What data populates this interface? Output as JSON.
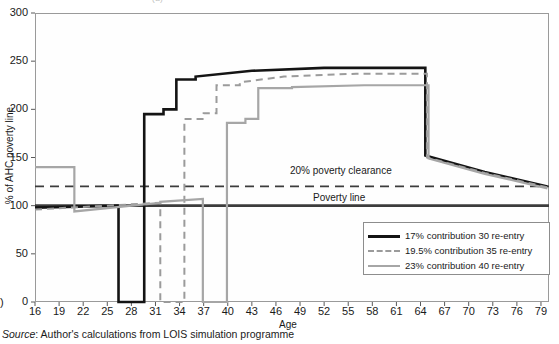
{
  "figure": {
    "title_sliver": "(a)",
    "source_prefix": "Source",
    "source_text": ": Author's calculations from LOIS simulation programme",
    "left_axis_stub": ")"
  },
  "annotations": {
    "clearance": "20% poverty clearance",
    "poverty": "Poverty line"
  },
  "legend": {
    "entries": [
      {
        "label": "17% contribution 30 re-entry",
        "style": "solid-black",
        "color": "#141414"
      },
      {
        "label": "19.5% contribution 35 re-entry",
        "style": "dashed-grey",
        "color": "#9b9b9b"
      },
      {
        "label": "23% contribution 40 re-entry",
        "style": "solid-grey",
        "color": "#a6a6a6"
      }
    ]
  },
  "chart_data": {
    "type": "line",
    "title": "",
    "xlabel": "Age",
    "ylabel": "% of AHC poverty line",
    "xlim": [
      16,
      80
    ],
    "ylim": [
      0,
      300
    ],
    "yticks": [
      0,
      50,
      100,
      150,
      200,
      250,
      300
    ],
    "xticks": [
      16,
      19,
      22,
      25,
      28,
      31,
      34,
      37,
      40,
      43,
      46,
      49,
      52,
      55,
      58,
      61,
      64,
      67,
      70,
      73,
      76,
      79
    ],
    "grid": false,
    "legend_position": "bottom-right",
    "reference_lines": [
      {
        "name": "20% poverty clearance",
        "value": 120,
        "style": "dashed",
        "color": "#3c3c3c"
      },
      {
        "name": "Poverty line",
        "value": 100,
        "style": "solid",
        "color": "#3c3c3c"
      }
    ],
    "series": [
      {
        "name": "17% contribution 30 re-entry",
        "color": "#141414",
        "style": "solid",
        "width": 2.6,
        "points": [
          [
            16,
            98
          ],
          [
            26.4,
            100
          ],
          [
            26.4,
            0
          ],
          [
            29.6,
            0
          ],
          [
            29.6,
            195
          ],
          [
            32.0,
            195
          ],
          [
            32.0,
            200
          ],
          [
            33.6,
            200
          ],
          [
            33.6,
            231
          ],
          [
            36.0,
            231
          ],
          [
            36.0,
            234
          ],
          [
            43.0,
            240
          ],
          [
            43.0,
            240
          ],
          [
            52.0,
            243
          ],
          [
            52.0,
            243
          ],
          [
            64.6,
            243
          ],
          [
            64.6,
            152
          ],
          [
            72.0,
            135
          ],
          [
            72.0,
            135
          ],
          [
            79.8,
            120
          ]
        ]
      },
      {
        "name": "19.5% contribution 35 re-entry",
        "color": "#9b9b9b",
        "style": "dashed",
        "width": 2.0,
        "points": [
          [
            16,
            96
          ],
          [
            31.6,
            103
          ],
          [
            31.6,
            0
          ],
          [
            34.6,
            0
          ],
          [
            34.6,
            190
          ],
          [
            37.0,
            190
          ],
          [
            37.0,
            196
          ],
          [
            38.6,
            196
          ],
          [
            38.6,
            225
          ],
          [
            41.5,
            225
          ],
          [
            41.5,
            228
          ],
          [
            47.0,
            234
          ],
          [
            47.0,
            234
          ],
          [
            56.0,
            237
          ],
          [
            56.0,
            237
          ],
          [
            64.8,
            237
          ],
          [
            64.8,
            150
          ],
          [
            72.0,
            134
          ],
          [
            72.0,
            134
          ],
          [
            79.8,
            119
          ]
        ]
      },
      {
        "name": "23% contribution 40 re-entry",
        "color": "#a6a6a6",
        "style": "solid",
        "width": 2.2,
        "points": [
          [
            16,
            140
          ],
          [
            20.9,
            140
          ],
          [
            20.9,
            94
          ],
          [
            31.6,
            103
          ],
          [
            31.6,
            104
          ],
          [
            36.9,
            107
          ],
          [
            36.9,
            0
          ],
          [
            39.9,
            0
          ],
          [
            39.9,
            186
          ],
          [
            42.2,
            186
          ],
          [
            42.2,
            190
          ],
          [
            43.8,
            190
          ],
          [
            43.8,
            222
          ],
          [
            48.0,
            222
          ],
          [
            48.0,
            223
          ],
          [
            57.0,
            225
          ],
          [
            57.0,
            225
          ],
          [
            65.0,
            225
          ],
          [
            65.0,
            149
          ],
          [
            72.0,
            133
          ],
          [
            72.0,
            133
          ],
          [
            79.8,
            118
          ]
        ]
      }
    ]
  }
}
